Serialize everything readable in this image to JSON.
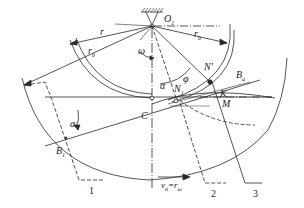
{
  "diagram": {
    "title": "",
    "colors": {
      "line": "#2a2a2a",
      "background": "#ffffff"
    },
    "labels": {
      "O1": "O",
      "O1_sub": "1",
      "r": "r",
      "rb": "r",
      "rb_sub": "b",
      "rb_right": "r",
      "rb_right_sub": "b",
      "omega": "ω",
      "alpha_top": "α",
      "phi": "φ",
      "N_prime": "N'",
      "N1": "N",
      "N1_sub": "1",
      "Ba": "B",
      "Ba_sub": "a",
      "K": "K",
      "M": "M",
      "C": "C",
      "alpha_left": "α",
      "B1": "B",
      "B1_sub": "1",
      "velocity": "v",
      "velocity_sub": "n",
      "velocity_eq": "=r",
      "velocity_eq_sub": "ω",
      "part1": "1",
      "part2": "2",
      "part3": "3"
    }
  }
}
